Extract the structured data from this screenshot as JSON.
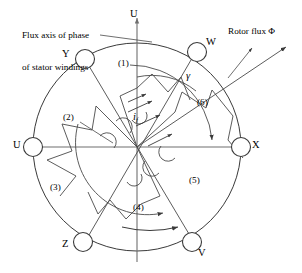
{
  "figure": {
    "type": "synchronous-machine-cross-section",
    "caption_line1": "Flux axis of phase",
    "caption_line2": "of stator windings",
    "rotor_flux_label": "Rotor flux Φ",
    "axis_label_u": "U",
    "field_current_label": "i",
    "field_current_sub": "f",
    "angle_label": "γ",
    "colors": {
      "stroke": "#3a3a3a",
      "axis": "#6f6f6f",
      "background": "#ffffff",
      "text": "#000000"
    }
  },
  "terminals": [
    {
      "id": "terminal-u",
      "label": "U",
      "angle_deg": 180,
      "cx": 33,
      "cy": 147,
      "r": 9.5,
      "label_x": 13,
      "label_y": 140
    },
    {
      "id": "terminal-y",
      "label": "Y",
      "angle_deg": 120,
      "cx": 85,
      "cy": 59,
      "r": 9.5,
      "label_x": 62,
      "label_y": 50
    },
    {
      "id": "terminal-w",
      "label": "W",
      "angle_deg": 60,
      "cx": 197,
      "cy": 52,
      "r": 9.5,
      "label_x": 206,
      "label_y": 40
    },
    {
      "id": "terminal-x",
      "label": "X",
      "angle_deg": 0,
      "cx": 241,
      "cy": 147,
      "r": 9.5,
      "label_x": 252,
      "label_y": 140
    },
    {
      "id": "terminal-v",
      "label": "V",
      "angle_deg": 300,
      "cx": 192,
      "cy": 242,
      "r": 9.5,
      "label_x": 201,
      "label_y": 247
    },
    {
      "id": "terminal-z",
      "label": "Z",
      "angle_deg": 240,
      "cx": 83,
      "cy": 242,
      "r": 9.5,
      "label_x": 62,
      "label_y": 240
    }
  ],
  "sectors": [
    {
      "id": "sector-1",
      "label": "(1)",
      "x": 120,
      "y": 60
    },
    {
      "id": "sector-2",
      "label": "(2)",
      "x": 66,
      "y": 114
    },
    {
      "id": "sector-3",
      "label": "(3)",
      "x": 52,
      "y": 184
    },
    {
      "id": "sector-4",
      "label": "(4)",
      "x": 136,
      "y": 204
    },
    {
      "id": "sector-5",
      "label": "(5)",
      "x": 191,
      "y": 177
    },
    {
      "id": "sector-6",
      "label": "(6)",
      "x": 199,
      "y": 99
    }
  ],
  "geometry": {
    "stator_circle": {
      "cx": 137,
      "cy": 147,
      "r": 104
    },
    "center": {
      "cx": 137,
      "cy": 147
    },
    "rotor_flux_arrow": {
      "x1": 185,
      "y1": 185,
      "x2": 285,
      "y2": 48
    },
    "u_axis": {
      "x1": 137,
      "y1": 260,
      "x2": 137,
      "y2": 14
    },
    "h_axis": {
      "x1": 26,
      "y1": 147,
      "x2": 250,
      "y2": 147
    },
    "rotation_arrow": {
      "x1": 124,
      "y1": 228,
      "x2": 178,
      "y2": 228
    }
  }
}
